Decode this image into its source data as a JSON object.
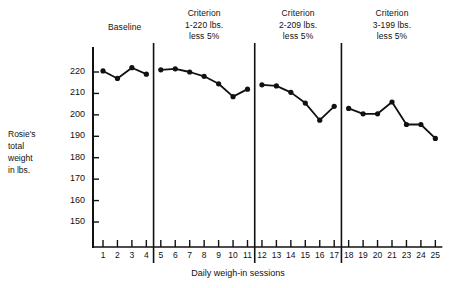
{
  "axis": {
    "y_title_lines": [
      "Rosie's",
      "total",
      "weight",
      "in lbs."
    ],
    "x_title": "Daily weigh-in sessions",
    "y_ticks": [
      150,
      160,
      170,
      180,
      190,
      200,
      210,
      220
    ],
    "x_ticks": [
      1,
      2,
      3,
      4,
      5,
      6,
      7,
      8,
      9,
      10,
      11,
      12,
      13,
      14,
      15,
      16,
      17,
      18,
      19,
      20,
      21,
      23,
      24,
      25
    ]
  },
  "phases": [
    {
      "name": "baseline",
      "header_lines": [
        "Baseline"
      ],
      "sessions": [
        1,
        2,
        3,
        4
      ]
    },
    {
      "name": "criterion-1",
      "header_lines": [
        "Criterion",
        "1-220 lbs.",
        "less 5%"
      ],
      "sessions": [
        5,
        6,
        7,
        8,
        9,
        10,
        11
      ]
    },
    {
      "name": "criterion-2",
      "header_lines": [
        "Criterion",
        "2-209 lbs.",
        "less 5%"
      ],
      "sessions": [
        12,
        13,
        14,
        15,
        16,
        17
      ]
    },
    {
      "name": "criterion-3",
      "header_lines": [
        "Criterion",
        "3-199 lbs.",
        "less 5%"
      ],
      "sessions": [
        18,
        19,
        20,
        21,
        23,
        24,
        25
      ]
    }
  ],
  "colors": {
    "line": "#111111",
    "marker": "#111111",
    "axis": "#111111",
    "background": "#ffffff"
  },
  "chart_data": {
    "type": "line",
    "title": "",
    "xlabel": "Daily weigh-in sessions",
    "ylabel": "Rosie's total weight in lbs.",
    "ylim": [
      145,
      224
    ],
    "xlim": [
      0.4,
      25.6
    ],
    "grid": false,
    "legend": null,
    "yticks": [
      150,
      160,
      170,
      180,
      190,
      200,
      210,
      220
    ],
    "xticks": [
      1,
      2,
      3,
      4,
      5,
      6,
      7,
      8,
      9,
      10,
      11,
      12,
      13,
      14,
      15,
      16,
      17,
      18,
      19,
      20,
      21,
      23,
      24,
      25
    ],
    "phase_labels": [
      "Baseline",
      "Criterion 1-220 lbs. less 5%",
      "Criterion 2-209 lbs. less 5%",
      "Criterion 3-199 lbs. less 5%"
    ],
    "phase_dividers_after_session": [
      4,
      11,
      17
    ],
    "series": [
      {
        "name": "Rosie's total weight",
        "segments": [
          {
            "phase": "Baseline",
            "x": [
              1,
              2,
              3,
              4
            ],
            "values": [
              220.5,
              217.0,
              222.0,
              219.0
            ]
          },
          {
            "phase": "Criterion 1-220 lbs. less 5%",
            "x": [
              5,
              6,
              7,
              8,
              9,
              10,
              11
            ],
            "values": [
              221.0,
              221.5,
              220.0,
              218.0,
              214.5,
              208.5,
              212.0
            ]
          },
          {
            "phase": "Criterion 2-209 lbs. less 5%",
            "x": [
              12,
              13,
              14,
              15,
              16,
              17
            ],
            "values": [
              214.0,
              213.5,
              210.5,
              205.5,
              197.5,
              204.0
            ]
          },
          {
            "phase": "Criterion 3-199 lbs. less 5%",
            "x": [
              18,
              19,
              20,
              21,
              23,
              24,
              25
            ],
            "values": [
              203.0,
              200.5,
              200.5,
              206.0,
              195.5,
              195.5,
              189.0
            ]
          }
        ]
      }
    ]
  }
}
